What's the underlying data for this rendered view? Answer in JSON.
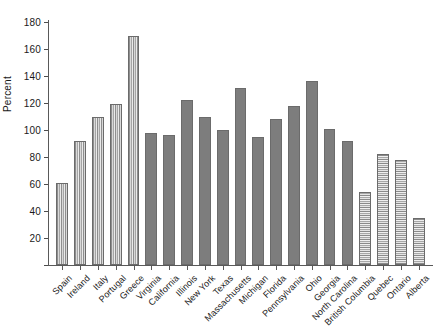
{
  "chart_data": {
    "type": "bar",
    "title": "",
    "xlabel": "",
    "ylabel": "Percent",
    "ylim": [
      0,
      180
    ],
    "ytick_values": [
      0,
      20,
      40,
      60,
      80,
      100,
      120,
      140,
      160,
      180
    ],
    "ytick_labels": [
      "",
      "20",
      "40",
      "60",
      "80",
      "100",
      "120",
      "140",
      "160",
      "180"
    ],
    "grid": false,
    "legend": "none",
    "categories": [
      "Spain",
      "Ireland",
      "Italy",
      "Portugal",
      "Greece",
      "Virginia",
      "California",
      "Illinois",
      "New York",
      "Texas",
      "Massachusetts",
      "Michigan",
      "Florida",
      "Pennsylvania",
      "Ohio",
      "Georgia",
      "North Carolina",
      "British Columbia",
      "Quebec",
      "Ontario",
      "Alberta"
    ],
    "values": [
      61,
      92,
      110,
      119,
      170,
      98,
      96,
      122,
      110,
      100,
      131,
      95,
      108,
      118,
      136,
      101,
      92,
      54,
      82,
      78,
      35
    ],
    "groups": [
      {
        "name": "Europe",
        "pattern": "vertical-hatch",
        "count": 5
      },
      {
        "name": "United States",
        "pattern": "checker-hatch",
        "count": 12
      },
      {
        "name": "Canada",
        "pattern": "horizontal-hatch",
        "count": 4
      }
    ],
    "bar_patterns": [
      "vertical-hatch",
      "vertical-hatch",
      "vertical-hatch",
      "vertical-hatch",
      "vertical-hatch",
      "checker-hatch",
      "checker-hatch",
      "checker-hatch",
      "checker-hatch",
      "checker-hatch",
      "checker-hatch",
      "checker-hatch",
      "checker-hatch",
      "checker-hatch",
      "checker-hatch",
      "checker-hatch",
      "checker-hatch",
      "horizontal-hatch",
      "horizontal-hatch",
      "horizontal-hatch",
      "horizontal-hatch"
    ],
    "colors": {
      "axis": "#595959",
      "text": "#1a1a1a",
      "bar_border": "#6b6b6b",
      "background": "#ffffff"
    }
  }
}
